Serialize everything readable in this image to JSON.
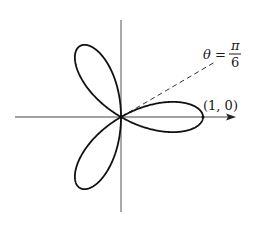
{
  "figure": {
    "type": "polar-rose",
    "equation": "r = cos(3θ)",
    "petals": 3,
    "petal_angles_deg": [
      0,
      120,
      240
    ],
    "origin_px": [
      121,
      117
    ],
    "unit_radius_px": 82,
    "colors": {
      "curve": "#111111",
      "axis": "#444444",
      "dashed": "#333333",
      "background": "#ffffff"
    }
  },
  "labels": {
    "point": "(1, 0)",
    "theta_lhs": "θ =",
    "pi": "π",
    "six": "6"
  },
  "ray": {
    "angle_label": "θ = π/6",
    "angle_deg": 30,
    "style": "dashed"
  },
  "axes": {
    "x_axis": {
      "from_px": [
        15,
        117
      ],
      "to_px": [
        235,
        117
      ],
      "arrow": true
    },
    "y_axis": {
      "from_px": [
        121,
        20
      ],
      "to_px": [
        121,
        212
      ],
      "arrow": false
    }
  }
}
